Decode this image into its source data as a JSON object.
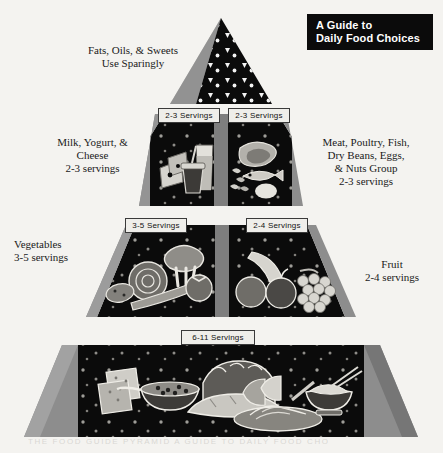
{
  "title_plate": {
    "line1": "A Guide to",
    "line2": "Daily Food Choices"
  },
  "tiers": {
    "fats": {
      "label": "Fats, Oils, & Sweets\nUse Sparingly",
      "symbols": "fat-triangles-and-sugar-dots"
    },
    "milk": {
      "label": "Milk, Yogurt, &\nCheese\n2-3 servings",
      "serving_tab": "2-3  Servings",
      "foods": "cheese-wedges-yogurt-cup-milk-glass"
    },
    "meat": {
      "label": "Meat,  Poultry, Fish,\nDry Beans, Eggs,\n& Nuts Group\n2-3 servings",
      "serving_tab": "2-3  Servings",
      "foods": "meat-cut-fish-beans-egg"
    },
    "vegetables": {
      "label": "Vegetables\n3-5 servings",
      "serving_tab": "3-5  Servings",
      "foods": "broccoli-lettuce-carrot-tomato-potato"
    },
    "fruit": {
      "label": "Fruit\n2-4 servings",
      "serving_tab": "2-4  Servings",
      "foods": "banana-orange-apple-grapes"
    },
    "grains": {
      "serving_tab": "6-11  Servings",
      "foods": "crackers-cereal-bowl-bread-loaves-pasta-rice-bowl"
    }
  },
  "footer_caption": "THE FOOD GUIDE PYRAMID A GUIDE TO DAILY FOOD CHOICES",
  "colors": {
    "page_background": "#f4f3f0",
    "panel_black": "#0b0b0b",
    "bevel_gray": "#8d8d8d",
    "bevel_light": "#b9b9b9",
    "bevel_dark": "#6e6e6e",
    "tab_fill": "#efeeea",
    "food_light": "#d8d6d0",
    "food_mid": "#9a9892"
  }
}
